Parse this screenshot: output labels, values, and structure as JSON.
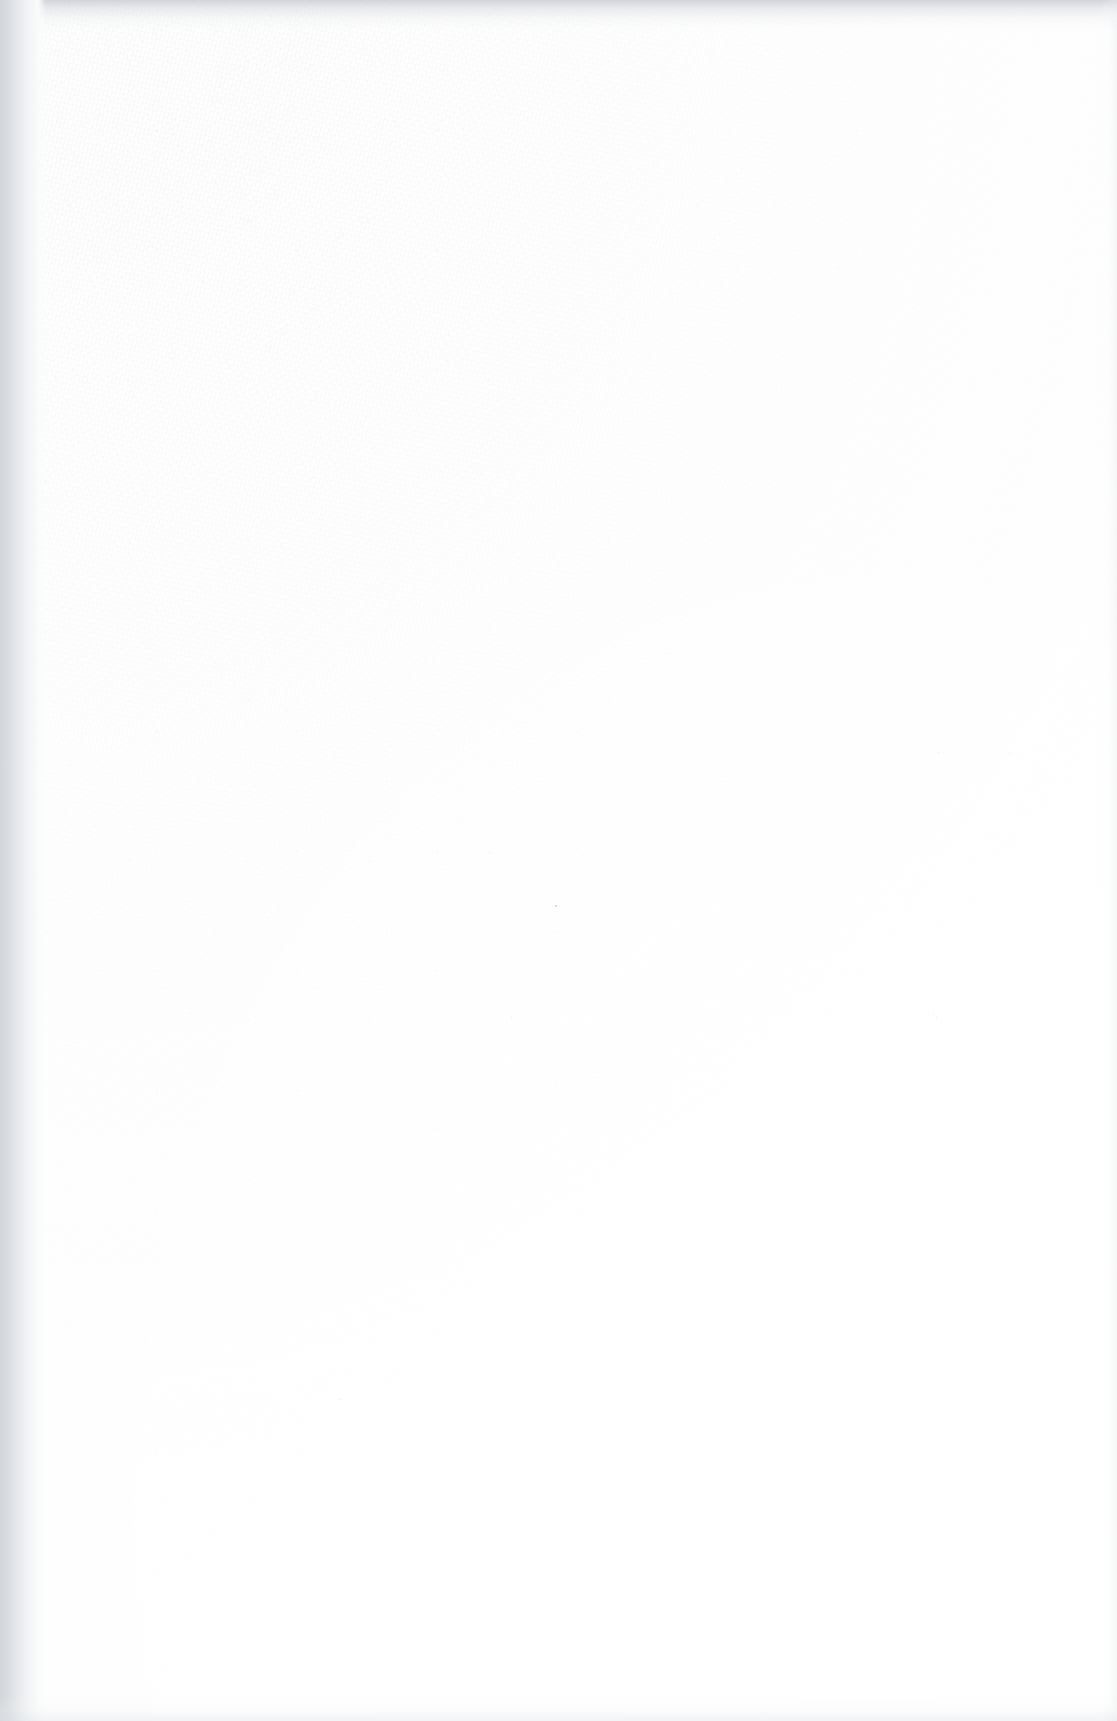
{
  "document": {
    "kind": "scanned-page",
    "state": "blank",
    "page_width_px": 1117,
    "page_height_px": 1721,
    "orientation": "portrait",
    "visible_text": "",
    "text_blocks": [],
    "figures": [],
    "tables": [],
    "rules": [],
    "page_number": "",
    "header_text": "",
    "footer_text": "",
    "marginalia": ""
  },
  "appearance": {
    "paper_color": "#fefefe",
    "paper_tone_note": "near-white fibrous stock",
    "grain_color": "#a6acb4",
    "left_edge_shadow_color": "#d3d6da",
    "top_edge_shadow_color": "#c4c9cf",
    "bottom_edge_shadow_color": "#dee1e5",
    "right_edge_shadow_color": "#ebedf0",
    "brightest_region": "lower-right",
    "darkest_region": "upper-left"
  },
  "artifacts": {
    "specks": [
      {
        "x": 555,
        "y": 905,
        "size": 2,
        "color": "#c9ccd1"
      },
      {
        "x": 489,
        "y": 852,
        "size": 1,
        "color": "#d8dadd"
      },
      {
        "x": 938,
        "y": 752,
        "size": 1,
        "color": "#dcdee1"
      },
      {
        "x": 1009,
        "y": 753,
        "size": 1,
        "color": "#dcdee1"
      },
      {
        "x": 936,
        "y": 1017,
        "size": 1,
        "color": "#dfe1e4"
      },
      {
        "x": 714,
        "y": 1014,
        "size": 1,
        "color": "#e0e2e5"
      },
      {
        "x": 933,
        "y": 1014,
        "size": 1,
        "color": "#e0e2e5"
      },
      {
        "x": 434,
        "y": 1129,
        "size": 1,
        "color": "#e2e4e7"
      },
      {
        "x": 340,
        "y": 1399,
        "size": 1,
        "color": "#e2e4e7"
      },
      {
        "x": 203,
        "y": 281,
        "size": 1,
        "color": "#cdd0d5"
      },
      {
        "x": 511,
        "y": 1017,
        "size": 1,
        "color": "#e1e3e6"
      }
    ]
  }
}
